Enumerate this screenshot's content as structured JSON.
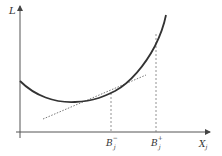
{
  "diagram": {
    "type": "convex-cost-curve-with-tangent",
    "y_axis": {
      "label": "L"
    },
    "x_axis": {
      "label": "X",
      "label_sub": "j"
    },
    "markers": [
      {
        "id": "b-minus",
        "label": "B",
        "sub": "j",
        "sup": "−"
      },
      {
        "id": "b-plus",
        "label": "B",
        "sub": "j",
        "sup": "+"
      }
    ],
    "curve": {
      "description": "convex curve L(X_j)",
      "color": "#333333"
    },
    "tangent": {
      "description": "dotted tangent line at B_j^-",
      "style": "dotted",
      "color": "#555555"
    },
    "guides": {
      "style": "dashed",
      "color": "#777777"
    }
  }
}
